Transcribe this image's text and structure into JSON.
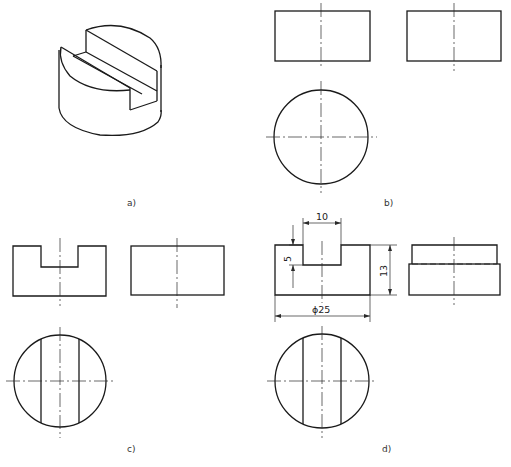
{
  "figure": {
    "panels": [
      {
        "id": "a",
        "label": "a)",
        "description": "isometric view of slotted cylinder"
      },
      {
        "id": "b",
        "label": "b)",
        "description": "three views of plain cylinder"
      },
      {
        "id": "c",
        "label": "c)",
        "description": "three views with slot, side view incomplete"
      },
      {
        "id": "d",
        "label": "d)",
        "description": "completed three views with dimensions"
      }
    ],
    "dimensions": {
      "slot_width": "10",
      "slot_depth": "5",
      "height": "13",
      "diameter": "ϕ25"
    },
    "colors": {
      "line": "#1a1a1a",
      "background": "#ffffff"
    }
  }
}
